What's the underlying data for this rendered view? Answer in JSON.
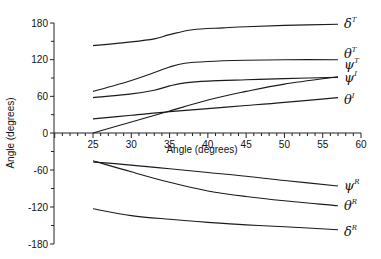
{
  "chart_data": {
    "type": "line",
    "title": "",
    "xlabel": "Angle (degrees)",
    "ylabel": "Angle (degrees)",
    "xlim": [
      20,
      60
    ],
    "ylim": [
      -180,
      180
    ],
    "grid": false,
    "legend": "inline labels at right end of each curve",
    "x_ticks": [
      25,
      30,
      35,
      40,
      45,
      50,
      55,
      60
    ],
    "y_ticks": [
      180,
      120,
      60,
      0,
      -60,
      -120,
      -180
    ],
    "series": [
      {
        "name": "δ^T",
        "base": "δ",
        "sup": "T",
        "x": [
          25,
          30,
          33,
          35,
          38,
          42,
          45,
          50,
          57
        ],
        "values": [
          143,
          149,
          154,
          161,
          169,
          172,
          174,
          176,
          178
        ]
      },
      {
        "name": "θ^T",
        "base": "θ",
        "sup": "T",
        "x": [
          25,
          30,
          33,
          35,
          37,
          40,
          45,
          50,
          57
        ],
        "values": [
          68,
          86,
          99,
          108,
          114,
          117,
          119,
          120,
          120
        ]
      },
      {
        "name": "ψ^T",
        "base": "ψ",
        "sup": "T",
        "x": [
          25,
          30,
          33,
          35,
          37,
          40,
          45,
          50,
          57
        ],
        "values": [
          58,
          64,
          70,
          77,
          82,
          85,
          87,
          89,
          91
        ]
      },
      {
        "name": "ψ^I",
        "base": "ψ",
        "sup": "I",
        "x": [
          25,
          30,
          35,
          40,
          45,
          50,
          57
        ],
        "values": [
          0,
          18,
          36,
          54,
          68,
          80,
          92
        ]
      },
      {
        "name": "θ^I",
        "base": "θ",
        "sup": "I",
        "x": [
          25,
          30,
          35,
          40,
          45,
          50,
          57
        ],
        "values": [
          23,
          29,
          35,
          40,
          45,
          50,
          58
        ]
      },
      {
        "name": "ψ^R",
        "base": "ψ",
        "sup": "R",
        "x": [
          25,
          30,
          35,
          40,
          45,
          50,
          57
        ],
        "values": [
          -47,
          -52,
          -58,
          -64,
          -70,
          -77,
          -86
        ]
      },
      {
        "name": "θ^R",
        "base": "θ",
        "sup": "R",
        "x": [
          25,
          30,
          35,
          40,
          45,
          50,
          57
        ],
        "values": [
          -45,
          -63,
          -80,
          -94,
          -103,
          -110,
          -118
        ]
      },
      {
        "name": "δ^R",
        "base": "δ",
        "sup": "R",
        "x": [
          25,
          30,
          35,
          40,
          45,
          50,
          57
        ],
        "values": [
          -123,
          -134,
          -140,
          -145,
          -149,
          -152,
          -157
        ]
      }
    ]
  },
  "labels": {
    "x_axis_title": "Angle (degrees)",
    "y_axis_title": "Angle (degrees)"
  }
}
